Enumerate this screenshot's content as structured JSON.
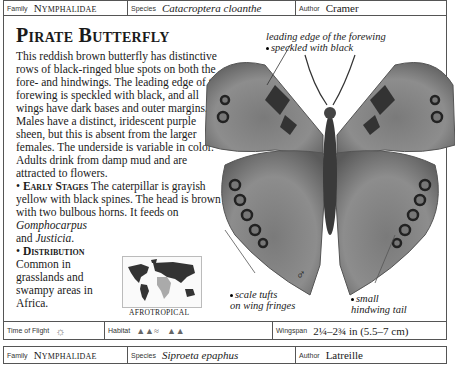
{
  "header": {
    "family_label": "Family",
    "family_value": "Nymphalidae",
    "species_label": "Species",
    "species_value": "Catacroptera cloanthe",
    "author_label": "Author",
    "author_value": "Cramer"
  },
  "entry": {
    "title": "Pirate Butterfly",
    "description": "This reddish brown butterfly has distinctive rows of black-ringed blue spots on both the fore- and hindwings. The leading edge of the forewing is speckled with black, and all wings have dark bases and outer margins. Males have a distinct, iridescent purple sheen, but this is absent from the larger females. The underside is variable in color. Adults drink from damp mud and are attracted to flowers.",
    "early_stages_heading": "Early Stages",
    "early_stages_text": "The caterpillar is grayish yellow with black spines. The head is brown with two bulbous horns. It feeds on",
    "food_plant_1": "Gomphocarpus",
    "food_and": "and",
    "food_plant_2": "Justicia",
    "distribution_heading": "Distribution",
    "distribution_text": "Common in grasslands and swampy areas in Africa.",
    "map_label": "Afrotropical",
    "sex_symbol": "♂"
  },
  "annotations": {
    "leading_edge": "leading edge of the forewing speckled with black",
    "leading_edge_l1": "leading edge of the forewing",
    "leading_edge_l2": "speckled with black",
    "scale_tufts_l1": "scale tufts",
    "scale_tufts_l2": "on wing fringes",
    "tail_l1": "small",
    "tail_l2": "hindwing tail"
  },
  "footer": {
    "time_label": "Time of Flight",
    "time_icon": "sun-icon",
    "habitat_label": "Habitat",
    "habitat_icons": [
      "wetland-icon",
      "grassland-icon"
    ],
    "wingspan_label": "Wingspan",
    "wingspan_value": "2¼–2¾ in (5.5–7 cm)"
  },
  "next_header": {
    "family_label": "Family",
    "family_value": "Nymphalidae",
    "species_label": "Species",
    "species_value": "Siproeta epaphus",
    "author_label": "Author",
    "author_value": "Latreille"
  }
}
